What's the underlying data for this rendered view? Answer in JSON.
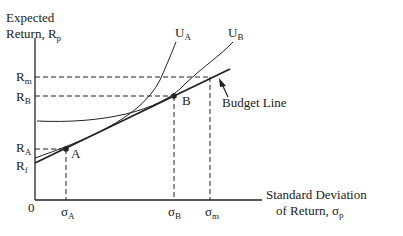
{
  "diagram": {
    "y_axis": {
      "label_line1": "Expected",
      "label_line2": "Return, R",
      "label_sub": "p"
    },
    "x_axis": {
      "label_line1": "Standard Deviation",
      "label_line2": "of Return, σ",
      "label_sub": "p"
    },
    "origin": "0",
    "y_ticks": [
      {
        "main": "R",
        "sub": "m"
      },
      {
        "main": "R",
        "sub": "B"
      },
      {
        "main": "R",
        "sub": "A"
      },
      {
        "main": "R",
        "sub": "f"
      }
    ],
    "x_ticks": [
      {
        "main": "σ",
        "sub": "A"
      },
      {
        "main": "σ",
        "sub": "B"
      },
      {
        "main": "σ",
        "sub": "m"
      }
    ],
    "curves": [
      {
        "main": "U",
        "sub": "A"
      },
      {
        "main": "U",
        "sub": "B"
      }
    ],
    "points": [
      {
        "label": "A"
      },
      {
        "label": "B"
      }
    ],
    "annotation": "Budget Line",
    "colors": {
      "line": "#222222",
      "background": "#ffffff"
    }
  }
}
